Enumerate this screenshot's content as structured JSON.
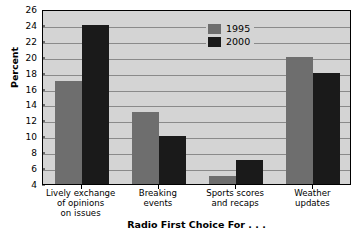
{
  "chart_data": {
    "type": "bar",
    "title": "",
    "subtitle": "",
    "xlabel": "Radio First Choice For . . .",
    "ylabel": "Percent",
    "categories": [
      "Lively exchange\nof opinions\non issues",
      "Breaking\nevents",
      "Sports scores\nand recaps",
      "Weather\nupdates"
    ],
    "category_lines": [
      [
        "Lively exchange",
        "of opinions",
        "on issues"
      ],
      [
        "Breaking",
        "events"
      ],
      [
        "Sports scores",
        "and recaps"
      ],
      [
        "Weather",
        "updates"
      ]
    ],
    "series": [
      {
        "name": "1995",
        "color": "#6e6e6e",
        "values": [
          17,
          13,
          5,
          20
        ]
      },
      {
        "name": "2000",
        "color": "#1a1a1a",
        "values": [
          24,
          10,
          7,
          18
        ]
      }
    ],
    "ylim": [
      4,
      26
    ],
    "ytick_values": [
      4,
      6,
      8,
      10,
      12,
      14,
      16,
      18,
      20,
      22,
      24,
      26
    ],
    "ytick_labels": [
      "4",
      "6",
      "8",
      "10",
      "12",
      "14",
      "16",
      "18",
      "20",
      "22",
      "24",
      "26"
    ],
    "grid": true,
    "grid_axis": "y",
    "legend_position": "top-right",
    "plot_background": "#d4d4d4",
    "figure_background": "#ffffff",
    "axis_color": "#000000",
    "gridline_color": "#8a8a8a"
  }
}
